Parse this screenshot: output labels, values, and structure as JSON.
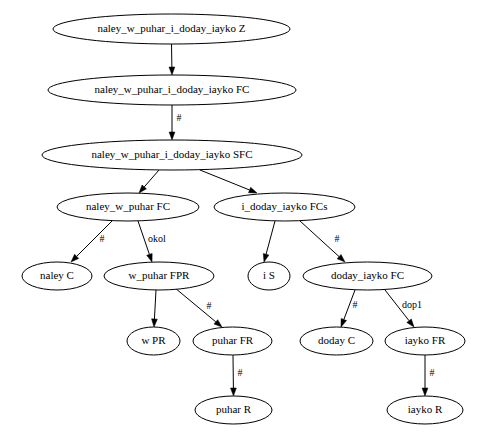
{
  "diagram": {
    "type": "directed-graph",
    "background_color": "#ffffff",
    "node_fill_color": "#ffffff",
    "node_stroke_color": "#000000",
    "text_color": "#000000",
    "nodes": [
      {
        "id": "n0",
        "label": "naley_w_puhar_i_doday_iayko Z",
        "cx": 171.5,
        "cy": 29,
        "rx": 118.5,
        "ry": 15
      },
      {
        "id": "n1",
        "label": "naley_w_puhar_i_doday_iayko FC",
        "cx": 172,
        "cy": 90,
        "rx": 124,
        "ry": 15
      },
      {
        "id": "n2",
        "label": "naley_w_puhar_i_doday_iayko SFC",
        "cx": 172,
        "cy": 155,
        "rx": 130,
        "ry": 15
      },
      {
        "id": "n3",
        "label": "naley_w_puhar FC",
        "cx": 128,
        "cy": 207,
        "rx": 71,
        "ry": 14
      },
      {
        "id": "n4",
        "label": "i_doday_iayko FCs",
        "cx": 284.5,
        "cy": 207,
        "rx": 70.5,
        "ry": 14
      },
      {
        "id": "n5",
        "label": "naley C",
        "cx": 57,
        "cy": 276,
        "rx": 35,
        "ry": 14
      },
      {
        "id": "n6",
        "label": "w_puhar FPR",
        "cx": 159,
        "cy": 276,
        "rx": 55,
        "ry": 14
      },
      {
        "id": "n7",
        "label": "i S",
        "cx": 269,
        "cy": 276,
        "rx": 21,
        "ry": 14
      },
      {
        "id": "n8",
        "label": "doday_iayko FC",
        "cx": 367.5,
        "cy": 276,
        "rx": 64.5,
        "ry": 14
      },
      {
        "id": "n9",
        "label": "w PR",
        "cx": 153.5,
        "cy": 341,
        "rx": 26.5,
        "ry": 14
      },
      {
        "id": "n10",
        "label": "puhar FR",
        "cx": 232.5,
        "cy": 341,
        "rx": 39.5,
        "ry": 14
      },
      {
        "id": "n11",
        "label": "doday C",
        "cx": 336.5,
        "cy": 341,
        "rx": 36.5,
        "ry": 14
      },
      {
        "id": "n12",
        "label": "iayko FR",
        "cx": 425,
        "cy": 341,
        "rx": 40,
        "ry": 14
      },
      {
        "id": "n13",
        "label": "puhar R",
        "cx": 233.5,
        "cy": 410,
        "rx": 38.5,
        "ry": 14
      },
      {
        "id": "n14",
        "label": "iayko R",
        "cx": 425,
        "cy": 410,
        "rx": 38,
        "ry": 14
      }
    ],
    "edges": [
      {
        "id": "e0",
        "from": "n0",
        "to": "n1",
        "label": "",
        "x1": 171.5,
        "y1": 44,
        "x2": 172,
        "y2": 75,
        "lx": 0,
        "ly": 0
      },
      {
        "id": "e1",
        "from": "n1",
        "to": "n2",
        "label": "#",
        "x1": 172,
        "y1": 105,
        "x2": 172,
        "y2": 140,
        "lx": 179,
        "ly": 119
      },
      {
        "id": "e2",
        "from": "n2",
        "to": "n3",
        "label": "",
        "x1": 159,
        "y1": 170,
        "x2": 139,
        "y2": 193,
        "lx": 0,
        "ly": 0
      },
      {
        "id": "e3",
        "from": "n2",
        "to": "n4",
        "label": "",
        "x1": 200,
        "y1": 170,
        "x2": 257,
        "y2": 193,
        "lx": 0,
        "ly": 0
      },
      {
        "id": "e4",
        "from": "n3",
        "to": "n5",
        "label": "#",
        "x1": 112,
        "y1": 221,
        "x2": 71,
        "y2": 262,
        "lx": 102,
        "ly": 240
      },
      {
        "id": "e5",
        "from": "n3",
        "to": "n6",
        "label": "okol",
        "x1": 138,
        "y1": 221,
        "x2": 152,
        "y2": 262,
        "lx": 157,
        "ly": 240
      },
      {
        "id": "e6",
        "from": "n4",
        "to": "n7",
        "label": "",
        "x1": 275,
        "y1": 221,
        "x2": 264,
        "y2": 262,
        "lx": 0,
        "ly": 0
      },
      {
        "id": "e7",
        "from": "n4",
        "to": "n8",
        "label": "#",
        "x1": 300,
        "y1": 221,
        "x2": 345,
        "y2": 262,
        "lx": 337,
        "ly": 240
      },
      {
        "id": "e8",
        "from": "n6",
        "to": "n9",
        "label": "",
        "x1": 156,
        "y1": 290,
        "x2": 154,
        "y2": 327,
        "lx": 0,
        "ly": 0
      },
      {
        "id": "e9",
        "from": "n6",
        "to": "n10",
        "label": "#",
        "x1": 175,
        "y1": 288,
        "x2": 222,
        "y2": 327,
        "lx": 209,
        "ly": 307
      },
      {
        "id": "e10",
        "from": "n8",
        "to": "n11",
        "label": "#",
        "x1": 355,
        "y1": 290,
        "x2": 341,
        "y2": 327,
        "lx": 355,
        "ly": 306
      },
      {
        "id": "e11",
        "from": "n8",
        "to": "n12",
        "label": "dop1",
        "x1": 385,
        "y1": 290,
        "x2": 414,
        "y2": 327,
        "lx": 412,
        "ly": 306
      },
      {
        "id": "e12",
        "from": "n10",
        "to": "n13",
        "label": "#",
        "x1": 233,
        "y1": 355,
        "x2": 233.5,
        "y2": 396,
        "lx": 240,
        "ly": 374
      },
      {
        "id": "e13",
        "from": "n12",
        "to": "n14",
        "label": "#",
        "x1": 425,
        "y1": 355,
        "x2": 425,
        "y2": 396,
        "lx": 432,
        "ly": 374
      }
    ]
  }
}
